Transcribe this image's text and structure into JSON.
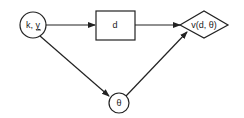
{
  "nodes": {
    "input": {
      "label_main": "k, ",
      "label_under": "y",
      "shape": "circle"
    },
    "decision": {
      "label": "d",
      "shape": "rectangle"
    },
    "value": {
      "label": "v(d, θ)",
      "shape": "diamond"
    },
    "chance": {
      "label": "θ",
      "shape": "circle"
    }
  },
  "edges": [
    {
      "from": "input",
      "to": "decision"
    },
    {
      "from": "decision",
      "to": "value"
    },
    {
      "from": "input",
      "to": "chance"
    },
    {
      "from": "chance",
      "to": "value"
    }
  ],
  "colors": {
    "stroke": "#222222",
    "background": "#ffffff"
  }
}
